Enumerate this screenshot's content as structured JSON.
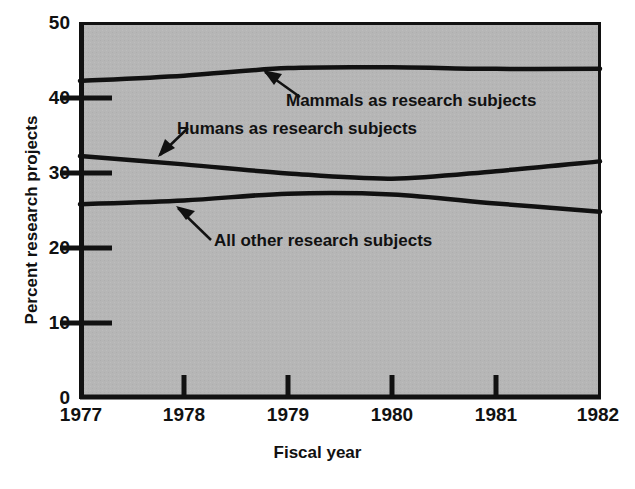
{
  "chart_data": {
    "type": "line",
    "title": "",
    "xlabel": "Fiscal year",
    "ylabel": "Percent research projects",
    "x": [
      1977,
      1978,
      1979,
      1980,
      1981,
      1982
    ],
    "categories": [
      "1977",
      "1978",
      "1979",
      "1980",
      "1981",
      "1982"
    ],
    "xlim": [
      1977,
      1982
    ],
    "ylim": [
      0,
      50
    ],
    "yticks": [
      0,
      10,
      20,
      30,
      40,
      50
    ],
    "ytick_labels": [
      "0",
      "10",
      "20",
      "30",
      "40",
      "50"
    ],
    "xticks": [
      1977,
      1978,
      1979,
      1980,
      1981,
      1982
    ],
    "xtick_labels": [
      "1977",
      "1978",
      "1979",
      "1980",
      "1981",
      "1982"
    ],
    "grid": false,
    "legend": "none",
    "plot_background": "#b5b5b5",
    "line_color": "#111111",
    "series": [
      {
        "name": "Mammals as research subjects",
        "values": [
          42.3,
          43.0,
          44.0,
          44.1,
          43.9,
          43.9
        ]
      },
      {
        "name": "Humans as research subjects",
        "values": [
          32.3,
          31.2,
          30.0,
          29.3,
          30.3,
          31.6
        ]
      },
      {
        "name": "All other research subjects",
        "values": [
          25.9,
          26.4,
          27.3,
          27.2,
          26.0,
          24.9
        ]
      }
    ],
    "annotations": [
      {
        "label": "Mammals as research subjects",
        "points_to": "mammals-line"
      },
      {
        "label": "Humans as research subjects",
        "points_to": "humans-line"
      },
      {
        "label": "All other research subjects",
        "points_to": "all-other-line"
      }
    ]
  },
  "axes": {
    "y_title": "Percent research projects",
    "x_title": "Fiscal year"
  }
}
